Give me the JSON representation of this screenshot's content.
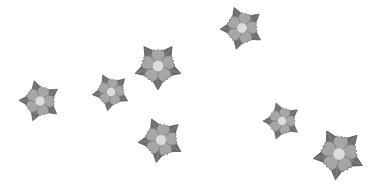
{
  "canvas": {
    "width": 375,
    "height": 194,
    "background": "#ffffff"
  },
  "colors": {
    "leaf": "#6e6e6e",
    "leaf_stroke": "#555555",
    "petal": "#a6a6a6",
    "petal_stroke": "#7a7a7a",
    "center": "#dcdcdc",
    "center_stroke": "#9a9a9a"
  },
  "flowers": [
    {
      "icon": "flower-icon",
      "cx": 40,
      "cy": 101,
      "size": 42,
      "rotation": 20
    },
    {
      "icon": "flower-icon",
      "cx": 111,
      "cy": 92,
      "size": 38,
      "rotation": 10
    },
    {
      "icon": "flower-icon",
      "cx": 158,
      "cy": 66,
      "size": 48,
      "rotation": 0
    },
    {
      "icon": "flower-icon",
      "cx": 242,
      "cy": 28,
      "size": 44,
      "rotation": 15
    },
    {
      "icon": "flower-icon",
      "cx": 161,
      "cy": 140,
      "size": 46,
      "rotation": 12
    },
    {
      "icon": "flower-icon",
      "cx": 282,
      "cy": 121,
      "size": 38,
      "rotation": 18
    },
    {
      "icon": "flower-icon",
      "cx": 339,
      "cy": 154,
      "size": 52,
      "rotation": 8
    }
  ]
}
